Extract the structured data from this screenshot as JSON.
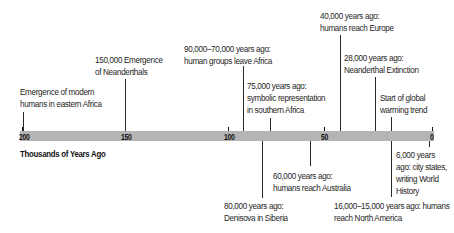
{
  "axis": {
    "title": "Thousands of Years Ago",
    "ticks": [
      {
        "label": "200",
        "x": 19
      },
      {
        "label": "150",
        "x": 121
      },
      {
        "label": "100",
        "x": 224
      },
      {
        "label": "50",
        "x": 322
      },
      {
        "label": "0",
        "x": 430
      }
    ],
    "bar_color": "#b4b4b4"
  },
  "events_above": [
    {
      "text_line1": "Emergence of modern",
      "text_line2": "humans in eastern Africa"
    },
    {
      "text_line1": "150,000 Emergence",
      "text_line2": "of Neanderthals"
    },
    {
      "text_line1": "90,000–70,000 years ago:",
      "text_line2": "human groups leave Africa"
    },
    {
      "text_line1": "75,000 years ago:",
      "text_line2": "symbolic representation",
      "text_line3": "in southern Africa"
    },
    {
      "text_line1": "40,000 years ago:",
      "text_line2": "humans reach Europe"
    },
    {
      "text_line1": "28,000 years ago:",
      "text_line2": "Neanderthal Extinction"
    },
    {
      "text_line1": "Start of global",
      "text_line2": "warming trend"
    }
  ],
  "events_below": [
    {
      "text_line1": "80,000 years ago:",
      "text_line2": "Denisova in Siberia"
    },
    {
      "text_line1": "60,000 years ago:",
      "text_line2": "humans reach Australia"
    },
    {
      "text_line1": "16,000–15,000 years ago: humans",
      "text_line2": "reach North America"
    },
    {
      "text_line1": "6,000 years",
      "text_line2": "ago: city states,",
      "text_line3": "writing World",
      "text_line4": "History"
    }
  ]
}
